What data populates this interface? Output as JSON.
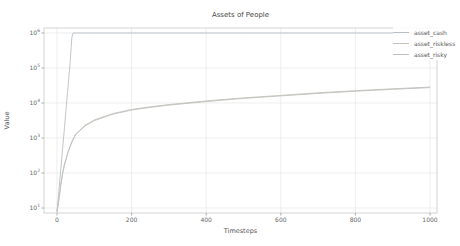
{
  "title": "Assets of People",
  "axes": {
    "x_label": "Timesteps",
    "y_label": "Value",
    "x_ticks": [
      0,
      200,
      400,
      600,
      800,
      1000
    ],
    "y_tick_exponents": [
      6,
      5,
      4,
      3,
      2,
      1
    ]
  },
  "colors": {
    "background": "#ffffff",
    "grid": "#e7e7e7",
    "spine": "#c9c9c9",
    "tick_mark": "#9a9a9a",
    "title_text": "#474747",
    "tick_text": "#666666",
    "label_text": "#555555"
  },
  "legend": {
    "items": [
      {
        "label": "asset_cash",
        "color": "#b8bec6"
      },
      {
        "label": "asset_riskless",
        "color": "#c4c2bb"
      },
      {
        "label": "asset_risky",
        "color": "#bcc3bc"
      }
    ]
  },
  "chart_data": {
    "type": "line",
    "title": "Assets of People",
    "xlabel": "Timesteps",
    "ylabel": "Value",
    "x_ticks": [
      0,
      200,
      400,
      600,
      800,
      1000
    ],
    "y_scale": "log",
    "y_tick_values": [
      10,
      100,
      1000,
      10000,
      100000,
      1000000
    ],
    "xlim": [
      -35,
      1018
    ],
    "ylim": [
      7.2,
      1400000
    ],
    "grid": true,
    "legend_position": "upper-right-outside",
    "series": [
      {
        "name": "asset_cash",
        "color": "#b8bec6",
        "points": [
          [
            0,
            8
          ],
          [
            5,
            30
          ],
          [
            10,
            120
          ],
          [
            15,
            500
          ],
          [
            20,
            2000
          ],
          [
            25,
            8000
          ],
          [
            30,
            33000
          ],
          [
            35,
            140000
          ],
          [
            38,
            400000
          ],
          [
            40,
            750000
          ],
          [
            43,
            1000000
          ],
          [
            100,
            1000000
          ],
          [
            200,
            1000000
          ],
          [
            300,
            1000000
          ],
          [
            400,
            1000000
          ],
          [
            500,
            1000000
          ],
          [
            600,
            1000000
          ],
          [
            700,
            1000000
          ],
          [
            800,
            1000000
          ],
          [
            900,
            1000000
          ],
          [
            1000,
            1000000
          ]
        ]
      },
      {
        "name": "asset_riskless",
        "color": "#c4c2bb",
        "points": [
          [
            0,
            8
          ],
          [
            5,
            18
          ],
          [
            10,
            45
          ],
          [
            15,
            100
          ],
          [
            20,
            180
          ],
          [
            30,
            420
          ],
          [
            40,
            800
          ],
          [
            50,
            1300
          ],
          [
            75,
            2300
          ],
          [
            100,
            3300
          ],
          [
            150,
            5000
          ],
          [
            200,
            6500
          ],
          [
            250,
            7800
          ],
          [
            300,
            9000
          ],
          [
            400,
            11500
          ],
          [
            500,
            14000
          ],
          [
            600,
            16500
          ],
          [
            700,
            19500
          ],
          [
            800,
            22500
          ],
          [
            900,
            25500
          ],
          [
            1000,
            28500
          ]
        ]
      },
      {
        "name": "asset_risky",
        "color": "#bcc3bc",
        "points": [
          [
            0,
            7.5
          ],
          [
            5,
            17
          ],
          [
            10,
            42
          ],
          [
            15,
            95
          ],
          [
            20,
            170
          ],
          [
            30,
            400
          ],
          [
            40,
            760
          ],
          [
            50,
            1250
          ],
          [
            75,
            2200
          ],
          [
            100,
            3150
          ],
          [
            150,
            4800
          ],
          [
            200,
            6300
          ],
          [
            250,
            7500
          ],
          [
            300,
            8700
          ],
          [
            400,
            11000
          ],
          [
            500,
            13500
          ],
          [
            600,
            16000
          ],
          [
            700,
            18800
          ],
          [
            800,
            21800
          ],
          [
            900,
            24700
          ],
          [
            1000,
            27500
          ]
        ]
      }
    ]
  }
}
